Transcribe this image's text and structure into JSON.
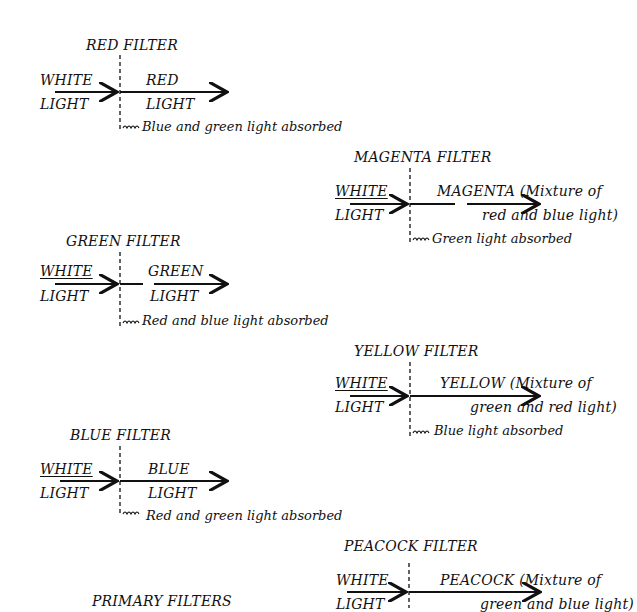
{
  "diagram": {
    "caption": "PRIMARY FILTERS",
    "filters": [
      {
        "title": "RED FILTER",
        "input_top": "WHITE",
        "input_bottom": "LIGHT",
        "output_top": "RED",
        "output_bottom": "LIGHT",
        "absorbed": "Blue and green light absorbed"
      },
      {
        "title": "MAGENTA FILTER",
        "input_top": "WHITE",
        "input_bottom": "LIGHT",
        "output_top": "MAGENTA  (Mixture of",
        "output_bottom": "red and blue light)",
        "absorbed": "Green light absorbed"
      },
      {
        "title": "GREEN FILTER",
        "input_top": "WHITE",
        "input_bottom": "LIGHT",
        "output_top": "GREEN",
        "output_bottom": "LIGHT",
        "absorbed": "Red and blue light absorbed"
      },
      {
        "title": "YELLOW FILTER",
        "input_top": "WHITE",
        "input_bottom": "LIGHT",
        "output_top": "YELLOW  (Mixture of",
        "output_bottom": "green and red light)",
        "absorbed": "Blue light absorbed"
      },
      {
        "title": "BLUE FILTER",
        "input_top": "WHITE",
        "input_bottom": "LIGHT",
        "output_top": "BLUE",
        "output_bottom": "LIGHT",
        "absorbed": "Red and green light absorbed"
      },
      {
        "title": "PEACOCK FILTER",
        "input_top": "WHITE",
        "input_bottom": "LIGHT",
        "output_top": "PEACOCK (Mixture of",
        "output_bottom": "green and blue light)",
        "absorbed": ""
      }
    ]
  }
}
